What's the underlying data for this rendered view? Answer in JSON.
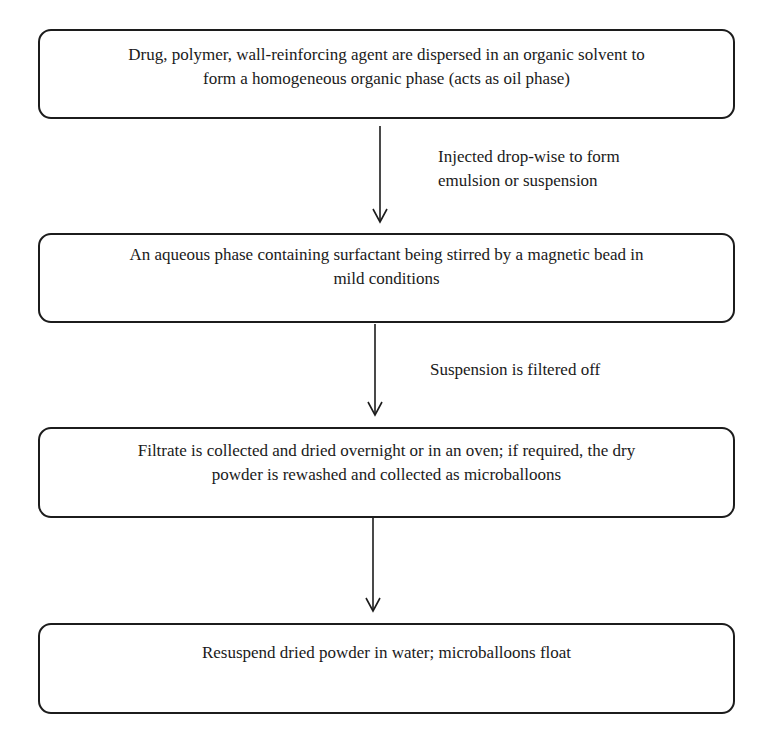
{
  "diagram": {
    "type": "flowchart",
    "direction": "top-to-bottom",
    "steps": [
      {
        "id": "step-1",
        "lines": [
          "Drug, polymer, wall-reinforcing agent are dispersed in an organic solvent to",
          "form a homogeneous organic phase (acts as oil phase)"
        ]
      },
      {
        "id": "step-2",
        "lines": [
          "An aqueous phase containing surfactant being stirred by a magnetic bead in",
          "mild conditions"
        ]
      },
      {
        "id": "step-3",
        "lines": [
          "Filtrate is collected and dried overnight or in an oven; if required, the dry",
          "powder is rewashed and collected as microballoons"
        ]
      },
      {
        "id": "step-4",
        "lines": [
          "Resuspend dried powder in water; microballoons float"
        ]
      }
    ],
    "transitions": [
      {
        "from": "step-1",
        "to": "step-2",
        "label_lines": [
          "Injected drop-wise to form",
          "emulsion or suspension"
        ]
      },
      {
        "from": "step-2",
        "to": "step-3",
        "label_lines": [
          "Suspension is filtered off"
        ]
      },
      {
        "from": "step-3",
        "to": "step-4",
        "label_lines": []
      }
    ]
  },
  "colors": {
    "stroke": "#1c1c1c",
    "text": "#1a1a1a",
    "background": "#ffffff"
  }
}
